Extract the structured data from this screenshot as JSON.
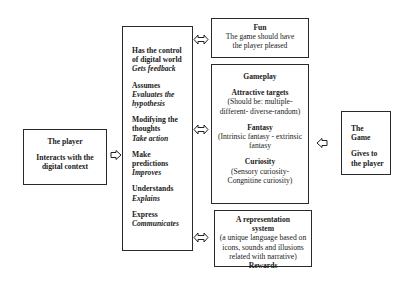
{
  "player_box": {
    "title": "The player",
    "subtitle": "Interacts with the digital context"
  },
  "middle_box": {
    "items": [
      {
        "action": "Has the control of digital world",
        "result": "Gets feedback"
      },
      {
        "action": "Assumes",
        "result": "Evaluates the hypothesis"
      },
      {
        "action": "Modifying the thoughts",
        "result": "Take action"
      },
      {
        "action": "Make predictions",
        "result": "Improves"
      },
      {
        "action": "Understands",
        "result": "Explains"
      },
      {
        "action": "Express",
        "result": "Communicates"
      }
    ]
  },
  "fun_box": {
    "title": "Fun",
    "text": "The game should have the player pleased"
  },
  "gameplay_box": {
    "title": "Gameplay",
    "sections": [
      {
        "heading": "Attractive targets",
        "text": "(Should be: multiple-different- diverse-random)"
      },
      {
        "heading": "Fantasy",
        "text": "(Intrinsic fantasy - extrinsic fantasy"
      },
      {
        "heading": "Curiosity",
        "text": "(Sensory curiosity-Congnitine curiosity)"
      }
    ]
  },
  "representation_box": {
    "title": "A representation system",
    "text": "(a unique language based on icons, sounds and illusions related with narrative)",
    "footer": "Rewards"
  },
  "game_box": {
    "title": "The Game",
    "subtitle": "Gives to the player"
  },
  "connectors": [
    {
      "from": "player_box",
      "to": "middle_box",
      "type": "single-arrow"
    },
    {
      "from": "middle_box",
      "to": "fun_box",
      "type": "double-arrow"
    },
    {
      "from": "middle_box",
      "to": "gameplay_box",
      "type": "double-arrow"
    },
    {
      "from": "middle_box",
      "to": "representation_box",
      "type": "double-arrow"
    },
    {
      "from": "game_box",
      "to": "gameplay_box",
      "type": "single-arrow"
    }
  ]
}
